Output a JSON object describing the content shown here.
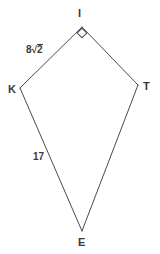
{
  "figure": {
    "name": "kite-KITE",
    "shape_type": "kite quadrilateral",
    "background_color": "#ffffff",
    "stroke_color": "#4a4a4a",
    "label_color": "#3a3a3a",
    "vertices": [
      {
        "id": "I",
        "label": "I",
        "x": 82,
        "y": 27,
        "label_x": 82,
        "label_y": 13
      },
      {
        "id": "T",
        "label": "T",
        "x": 138,
        "y": 85,
        "label_x": 147,
        "label_y": 86
      },
      {
        "id": "E",
        "label": "E",
        "x": 82,
        "y": 231,
        "label_x": 82,
        "label_y": 242
      },
      {
        "id": "K",
        "label": "K",
        "x": 20,
        "y": 88,
        "label_x": 12,
        "label_y": 89
      }
    ],
    "sides": [
      {
        "id": "KI",
        "from": "K",
        "to": "I",
        "label": "8√2",
        "label_coefficient": "8",
        "label_radicand": "2",
        "has_radical": true
      },
      {
        "id": "IT",
        "from": "I",
        "to": "T",
        "label": ""
      },
      {
        "id": "TE",
        "from": "T",
        "to": "E",
        "label": ""
      },
      {
        "id": "KE",
        "from": "K",
        "to": "E",
        "label": "17",
        "has_radical": false
      }
    ],
    "angle_markers": [
      {
        "at_vertex": "I",
        "type": "right-angle",
        "marker_shape": "square",
        "size": 7,
        "x": 82,
        "y": 32
      }
    ]
  }
}
